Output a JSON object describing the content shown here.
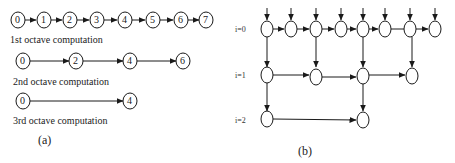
{
  "diagram_a": {
    "caption": "(a)",
    "rows": [
      {
        "label": "1st octave   computation",
        "nodes": [
          "0",
          "1",
          "2",
          "3",
          "4",
          "5",
          "6",
          "7"
        ]
      },
      {
        "label": "2nd octave  computation",
        "nodes": [
          "0",
          "2",
          "4",
          "6"
        ]
      },
      {
        "label": "3rd octave  computation",
        "nodes": [
          "0",
          "4"
        ]
      }
    ]
  },
  "diagram_b": {
    "caption": "(b)",
    "levels": [
      {
        "label": "i=0",
        "node_count": 8
      },
      {
        "label": "i=1",
        "node_count": 4
      },
      {
        "label": "i=2",
        "node_count": 2
      }
    ]
  },
  "colors": {
    "stroke": "#1a1a1a",
    "background": "#ffffff"
  }
}
